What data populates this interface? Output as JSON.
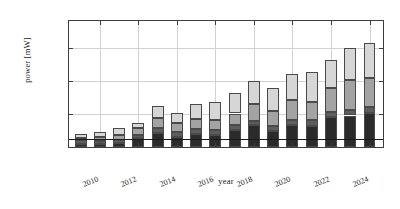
{
  "chart_data": {
    "type": "bar",
    "subtype": "stacked-bar",
    "title": "",
    "xlabel": "year",
    "ylabel": "power [mW]",
    "categories": [
      2009,
      2010,
      2011,
      2012,
      2013,
      2014,
      2015,
      2016,
      2017,
      2018,
      2019,
      2020,
      2021,
      2022,
      2023,
      2024
    ],
    "xtick_labels": [
      "2010",
      "2012",
      "2014",
      "2016",
      "2018",
      "2020",
      "2022",
      "2024"
    ],
    "xtick_values": [
      2010,
      2012,
      2014,
      2016,
      2018,
      2020,
      2022,
      2024
    ],
    "ytick_labels": [
      "0",
      "2000",
      "4000",
      "6000"
    ],
    "ytick_values": [
      0,
      2000,
      4000,
      6000
    ],
    "ylim": [
      0,
      7600
    ],
    "xlim": [
      2008.4,
      2024.7
    ],
    "grid": true,
    "legend": false,
    "series": [
      {
        "name": "segment-1",
        "color": "#2b2b2b",
        "values": [
          180,
          160,
          240,
          520,
          840,
          620,
          760,
          730,
          1020,
          1300,
          950,
          1300,
          1270,
          1780,
          1900,
          2050
        ]
      },
      {
        "name": "segment-2",
        "color": "#5d5d5d",
        "values": [
          230,
          200,
          160,
          210,
          300,
          290,
          300,
          320,
          300,
          280,
          340,
          310,
          330,
          330,
          340,
          370
        ]
      },
      {
        "name": "segment-3",
        "color": "#a3a3a3",
        "values": [
          140,
          230,
          330,
          420,
          620,
          510,
          640,
          560,
          700,
          1030,
          870,
          1220,
          1140,
          1450,
          1800,
          1750
        ]
      },
      {
        "name": "segment-4",
        "color": "#d6d6d6",
        "values": [
          240,
          310,
          440,
          290,
          720,
          660,
          910,
          1100,
          1240,
          1400,
          1420,
          1600,
          1780,
          1700,
          1950,
          2080
        ]
      }
    ],
    "totals": [
      790,
      900,
      1170,
      1440,
      2480,
      2080,
      2610,
      2710,
      3260,
      4010,
      3580,
      4430,
      4520,
      5260,
      5990,
      6250
    ],
    "reference_line": {
      "name": "threshold-line",
      "value": 500,
      "orientation": "horizontal",
      "color": "#1a1a1a"
    }
  }
}
